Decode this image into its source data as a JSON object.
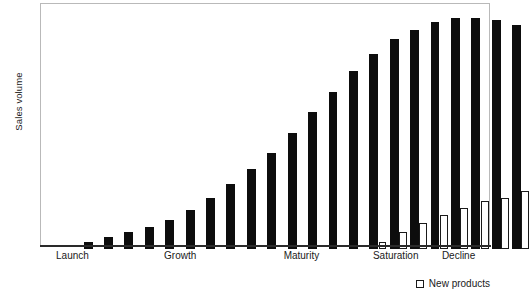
{
  "chart_data": {
    "type": "bar",
    "title": "",
    "xlabel": "",
    "ylabel": "Sales volume",
    "grid": false,
    "legend_position": "bottom-right",
    "ylim": [
      0,
      100
    ],
    "axis_ticks_visible": false,
    "categories": [
      "1",
      "2",
      "3",
      "4",
      "5",
      "6",
      "7",
      "8",
      "9",
      "10",
      "11",
      "12",
      "13",
      "14",
      "15",
      "16",
      "17",
      "18",
      "19",
      "20",
      "21",
      "22"
    ],
    "stages": [
      {
        "label": "Launch",
        "center_x_pct": 7
      },
      {
        "label": "Growth",
        "center_x_pct": 31
      },
      {
        "label": "Maturity",
        "center_x_pct": 58
      },
      {
        "label": "Saturation",
        "center_x_pct": 79
      },
      {
        "label": "Decline",
        "center_x_pct": 93
      }
    ],
    "series": [
      {
        "name": "Sales volume",
        "color": "#0d0d0d",
        "style": "filled",
        "values": [
          3,
          5,
          7,
          9,
          12,
          16,
          21,
          27,
          33,
          40,
          48,
          57,
          65,
          74,
          81,
          87,
          91,
          94,
          96,
          96,
          95,
          93
        ]
      },
      {
        "name": "New products",
        "color": "#ffffff",
        "style": "outlined",
        "values": [
          0,
          0,
          0,
          0,
          0,
          0,
          0,
          0,
          0,
          0,
          0,
          0,
          0,
          0,
          3,
          7,
          11,
          14,
          17,
          20,
          21,
          24
        ]
      }
    ]
  },
  "legend": {
    "items": [
      {
        "label": "New products",
        "swatch": "open-square"
      }
    ]
  }
}
